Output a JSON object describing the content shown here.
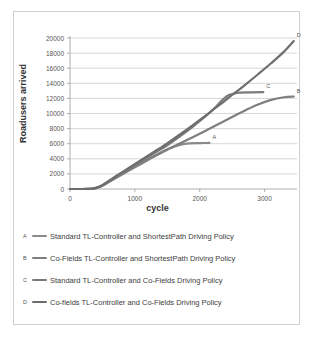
{
  "chart_data": {
    "type": "line",
    "title": "",
    "xlabel": "cycle",
    "ylabel": "Roadusers arrived",
    "xlim": [
      0,
      3500
    ],
    "ylim": [
      0,
      20000
    ],
    "grid": true,
    "legend_position": "below",
    "xticks": [
      0,
      1000,
      2000,
      3000
    ],
    "yticks": [
      0,
      2000,
      4000,
      6000,
      8000,
      10000,
      12000,
      14000,
      16000,
      18000,
      20000
    ],
    "series": [
      {
        "key": "A",
        "name": "Standard TL-Controller and ShortestPath Driving Policy",
        "color": "#8a8a8a",
        "end_label": "A",
        "x": [
          0,
          200,
          350,
          450,
          550,
          700,
          900,
          1100,
          1300,
          1500,
          1650,
          1750,
          1850,
          1950,
          2050,
          2150
        ],
        "y": [
          0,
          0,
          40,
          260,
          700,
          1500,
          2500,
          3450,
          4400,
          5250,
          5750,
          5950,
          6050,
          6080,
          6090,
          6100
        ]
      },
      {
        "key": "B",
        "name": "Co-Fields TL-Controller and ShortestPath Driving Policy",
        "color": "#7f7f7f",
        "end_label": "B",
        "x": [
          0,
          200,
          350,
          450,
          550,
          700,
          900,
          1100,
          1300,
          1500,
          1700,
          1900,
          2100,
          2300,
          2500,
          2700,
          2900,
          3100,
          3300,
          3450
        ],
        "y": [
          0,
          0,
          30,
          230,
          650,
          1420,
          2400,
          3350,
          4300,
          5200,
          6050,
          6900,
          7750,
          8650,
          9550,
          10400,
          11200,
          11800,
          12150,
          12250
        ]
      },
      {
        "key": "C",
        "name": "Standard TL-Controller and Co-Fields Driving Policy",
        "color": "#7a7a7a",
        "end_label": "C",
        "x": [
          0,
          200,
          350,
          450,
          550,
          700,
          900,
          1100,
          1300,
          1500,
          1700,
          1900,
          2100,
          2250,
          2350,
          2450,
          2600,
          2800,
          2980
        ],
        "y": [
          0,
          0,
          45,
          280,
          760,
          1600,
          2650,
          3700,
          4750,
          5800,
          7000,
          8300,
          9700,
          10900,
          11800,
          12450,
          12750,
          12800,
          12820
        ]
      },
      {
        "key": "D",
        "name": "Co-fields TL-Controller and Co-Fields Driving Policy",
        "color": "#6e6e6e",
        "end_label": "D",
        "x": [
          0,
          200,
          350,
          450,
          550,
          700,
          900,
          1100,
          1300,
          1500,
          1700,
          1900,
          2100,
          2300,
          2500,
          2700,
          2900,
          3100,
          3300,
          3450
        ],
        "y": [
          0,
          0,
          45,
          290,
          790,
          1650,
          2750,
          3850,
          4950,
          6050,
          7250,
          8500,
          9800,
          11100,
          12450,
          13800,
          15200,
          16650,
          18200,
          19600
        ]
      }
    ]
  }
}
